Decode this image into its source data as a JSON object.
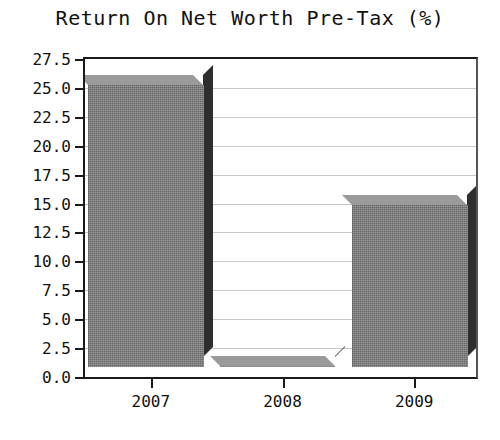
{
  "chart_data": {
    "type": "bar",
    "title": "Return On Net Worth Pre-Tax (%)",
    "xlabel": "",
    "ylabel": "",
    "categories": [
      "2007",
      "2008",
      "2009"
    ],
    "values": [
      24.4,
      0.1,
      14.0
    ],
    "series": [
      {
        "name": "Return On Net Worth Pre-Tax (%)",
        "values": [
          24.4,
          0.1,
          14.0
        ]
      }
    ],
    "ylim": [
      0.0,
      27.5
    ],
    "ytick_step": 2.5,
    "ytick_labels": [
      "27.5",
      "25.0",
      "22.5",
      "20.0",
      "17.5",
      "15.0",
      "12.5",
      "10.0",
      "7.5",
      "5.0",
      "2.5",
      "0.0"
    ],
    "ytick_values": [
      27.5,
      25.0,
      22.5,
      20.0,
      17.5,
      15.0,
      12.5,
      10.0,
      7.5,
      5.0,
      2.5,
      0.0
    ],
    "grid": true,
    "legend": false,
    "legend_position": "none",
    "style": "3d-bar",
    "colors": {
      "bar_face": "#808080",
      "bar_side": "#2e2e2e",
      "bar_top": "#9a9a9a",
      "axis": "#1a1a1a",
      "grid": "#c9c9c9",
      "background": "#ffffff",
      "text": "#111111"
    }
  }
}
